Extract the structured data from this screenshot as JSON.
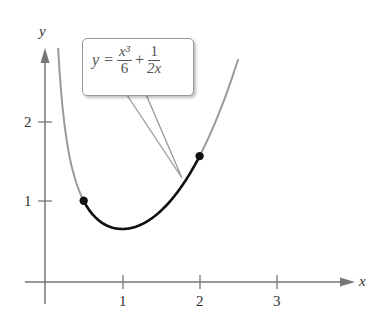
{
  "chart_data": {
    "type": "line",
    "title": "",
    "function": "y = x^3/6 + 1/(2x)",
    "xlabel": "x",
    "ylabel": "y",
    "x_ticks": [
      1,
      2,
      3
    ],
    "y_ticks": [
      1,
      2
    ],
    "xlim": [
      0,
      3.9
    ],
    "ylim": [
      0,
      3.0
    ],
    "grid": false,
    "series": [
      {
        "name": "full curve",
        "color": "#999999",
        "x_range": [
          0.17,
          2.5
        ]
      },
      {
        "name": "highlighted arc",
        "color": "#111111",
        "x_range": [
          0.5,
          2.0
        ]
      }
    ],
    "points": [
      {
        "x": 0.5,
        "y": 1.0208
      },
      {
        "x": 2.0,
        "y": 1.5833
      }
    ]
  },
  "axis": {
    "x_label": "x",
    "y_label": "y",
    "x_tick_labels": [
      "1",
      "2",
      "3"
    ],
    "y_tick_labels": [
      "1",
      "2"
    ]
  },
  "callout": {
    "lhs": "y =",
    "frac1_num": "x³",
    "frac1_den": "6",
    "plus": "+",
    "frac2_num": "1",
    "frac2_den": "2x"
  }
}
